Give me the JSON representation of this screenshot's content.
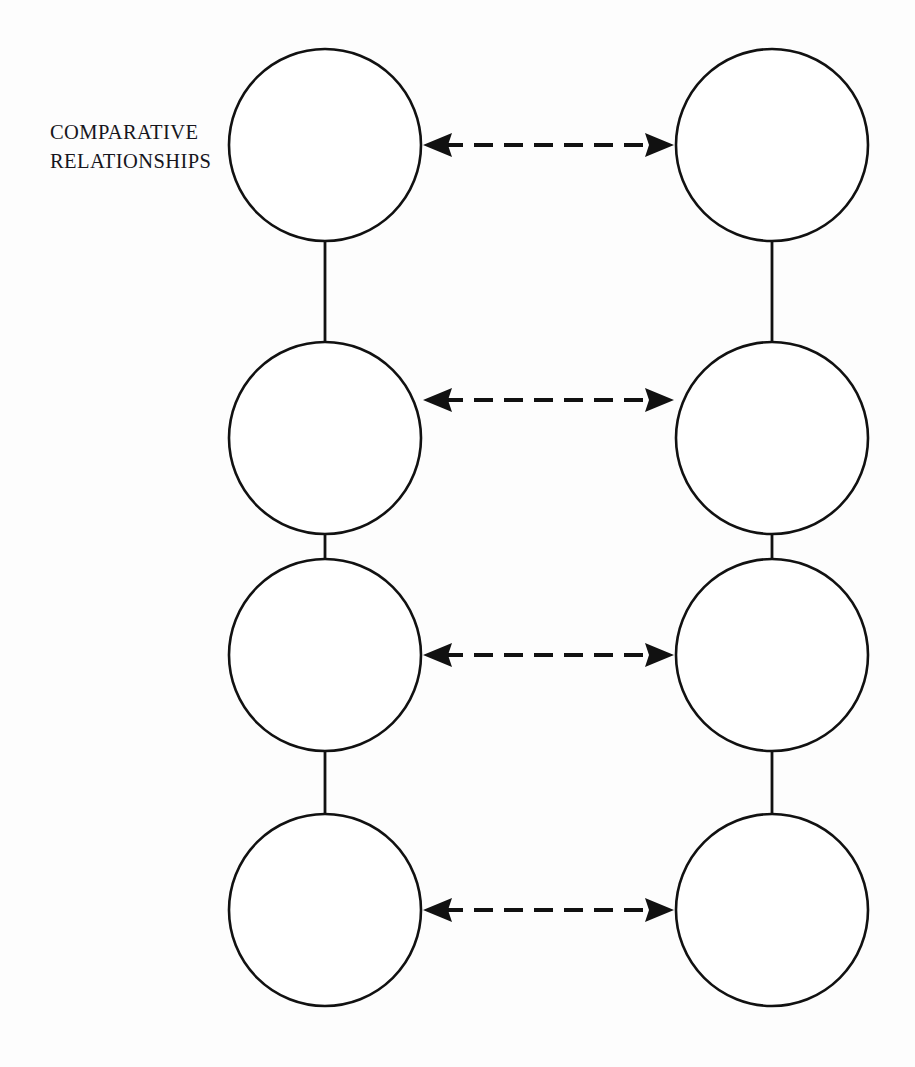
{
  "page": {
    "width": 915,
    "height": 1067,
    "background_color": "#fdfdfd",
    "ink_color": "#111111"
  },
  "label": {
    "name": "comparative-relationships-label",
    "line1": "COMPARATIVE",
    "line2": "RELATIONSHIPS",
    "text": "COMPARATIVE\nRELATIONSHIPS",
    "x": 50,
    "y": 118,
    "font_size_px": 20.5,
    "color": "#17161c"
  },
  "diagram": {
    "type": "node-link",
    "columns": [
      {
        "id": "left",
        "center_x": 325,
        "label": ""
      },
      {
        "id": "right",
        "center_x": 772,
        "label": ""
      }
    ],
    "rows": [
      {
        "index": 1,
        "center_y": 145,
        "radius": 97
      },
      {
        "index": 2,
        "center_y": 438,
        "radius": 97
      },
      {
        "index": 3,
        "center_y": 655,
        "radius": 97
      },
      {
        "index": 4,
        "center_y": 910,
        "radius": 97
      }
    ],
    "nodes": [
      {
        "id": "left-1",
        "column": "left",
        "row": 1,
        "cx": 325,
        "cy": 145,
        "r": 97,
        "text": "",
        "fill": "#ffffff",
        "stroke": "#111111"
      },
      {
        "id": "left-2",
        "column": "left",
        "row": 2,
        "cx": 325,
        "cy": 438,
        "r": 97,
        "text": "",
        "fill": "#ffffff",
        "stroke": "#111111"
      },
      {
        "id": "left-3",
        "column": "left",
        "row": 3,
        "cx": 325,
        "cy": 655,
        "r": 97,
        "text": "",
        "fill": "#ffffff",
        "stroke": "#111111"
      },
      {
        "id": "left-4",
        "column": "left",
        "row": 4,
        "cx": 325,
        "cy": 910,
        "r": 97,
        "text": "",
        "fill": "#ffffff",
        "stroke": "#111111"
      },
      {
        "id": "right-1",
        "column": "right",
        "row": 1,
        "cx": 772,
        "cy": 145,
        "r": 97,
        "text": "",
        "fill": "#ffffff",
        "stroke": "#111111"
      },
      {
        "id": "right-2",
        "column": "right",
        "row": 2,
        "cx": 772,
        "cy": 438,
        "r": 97,
        "text": "",
        "fill": "#ffffff",
        "stroke": "#111111"
      },
      {
        "id": "right-3",
        "column": "right",
        "row": 3,
        "cx": 772,
        "cy": 655,
        "r": 97,
        "text": "",
        "fill": "#ffffff",
        "stroke": "#111111"
      },
      {
        "id": "right-4",
        "column": "right",
        "row": 4,
        "cx": 772,
        "cy": 910,
        "r": 97,
        "text": "",
        "fill": "#ffffff",
        "stroke": "#111111"
      }
    ],
    "vertical_links": [
      {
        "id": "v-left-1-2",
        "from": "left-1",
        "to": "left-2",
        "x": 325,
        "y1": 242,
        "y2": 341,
        "style": "solid"
      },
      {
        "id": "v-left-2-3",
        "from": "left-2",
        "to": "left-3",
        "x": 325,
        "y1": 535,
        "y2": 558,
        "style": "solid"
      },
      {
        "id": "v-left-3-4",
        "from": "left-3",
        "to": "left-4",
        "x": 325,
        "y1": 752,
        "y2": 813,
        "style": "solid"
      },
      {
        "id": "v-right-1-2",
        "from": "right-1",
        "to": "right-2",
        "x": 772,
        "y1": 242,
        "y2": 341,
        "style": "solid"
      },
      {
        "id": "v-right-2-3",
        "from": "right-2",
        "to": "right-3",
        "x": 772,
        "y1": 535,
        "y2": 558,
        "style": "solid"
      },
      {
        "id": "v-right-3-4",
        "from": "right-3",
        "to": "right-4",
        "x": 772,
        "y1": 752,
        "y2": 813,
        "style": "solid"
      }
    ],
    "comparative_arrows": [
      {
        "id": "arrow-row-1",
        "row": 1,
        "from": "left-1",
        "to": "right-1",
        "y": 145,
        "x1": 424,
        "x2": 673,
        "style": "dashed",
        "heads": "both"
      },
      {
        "id": "arrow-row-2",
        "row": 2,
        "from": "left-2",
        "to": "right-2",
        "y": 400,
        "x1": 424,
        "x2": 673,
        "style": "dashed",
        "heads": "both"
      },
      {
        "id": "arrow-row-3",
        "row": 3,
        "from": "left-3",
        "to": "right-3",
        "y": 655,
        "x1": 424,
        "x2": 673,
        "style": "dashed",
        "heads": "both"
      },
      {
        "id": "arrow-row-4",
        "row": 4,
        "from": "left-4",
        "to": "right-4",
        "y": 910,
        "x1": 424,
        "x2": 673,
        "style": "dashed",
        "heads": "both"
      }
    ]
  }
}
